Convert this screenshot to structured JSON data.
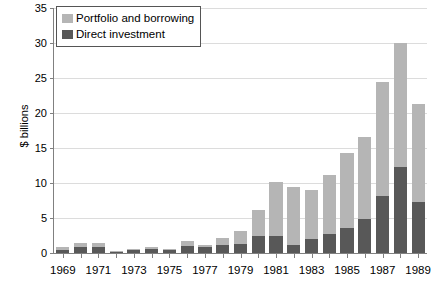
{
  "chart_data": {
    "type": "bar",
    "title": "",
    "subtitle": "",
    "xlabel": "",
    "ylabel": "$ billions",
    "ylim": [
      0,
      35
    ],
    "ytick_step": 5,
    "yticks": [
      "0",
      "5",
      "10",
      "15",
      "20",
      "25",
      "30",
      "35"
    ],
    "grid": true,
    "stacked": true,
    "legend_position": "top-left",
    "categories": [
      "1969",
      "1970",
      "1971",
      "1972",
      "1973",
      "1974",
      "1975",
      "1976",
      "1977",
      "1978",
      "1979",
      "1980",
      "1981",
      "1982",
      "1983",
      "1984",
      "1985",
      "1986",
      "1987",
      "1988",
      "1989"
    ],
    "xtick_labels": [
      "1969",
      "",
      "1971",
      "",
      "1973",
      "",
      "1975",
      "",
      "1977",
      "",
      "1979",
      "",
      "1981",
      "",
      "1983",
      "",
      "1985",
      "",
      "1987",
      "",
      "1989"
    ],
    "series": [
      {
        "name": "Direct investment",
        "color": "#585858",
        "values": [
          0.5,
          0.8,
          0.8,
          0.2,
          0.4,
          0.6,
          0.4,
          1.0,
          0.9,
          1.1,
          1.3,
          2.5,
          2.5,
          1.1,
          2.0,
          2.7,
          3.6,
          4.8,
          8.1,
          12.3,
          7.3
        ]
      },
      {
        "name": "Portfolio and borrowing",
        "color": "#b5b5b5",
        "values": [
          0.4,
          0.7,
          0.7,
          0.1,
          0.2,
          0.3,
          0.2,
          0.7,
          0.3,
          1.1,
          1.9,
          3.7,
          7.6,
          8.4,
          7.0,
          8.4,
          10.7,
          11.8,
          16.3,
          17.7,
          14.0
        ]
      }
    ],
    "totals": [
      0.9,
      1.5,
      1.5,
      0.3,
      0.6,
      0.9,
      0.6,
      1.7,
      1.2,
      2.2,
      3.2,
      6.2,
      10.1,
      9.5,
      9.0,
      11.1,
      14.3,
      16.6,
      24.4,
      30.0,
      21.3
    ]
  },
  "legend": {
    "items": [
      {
        "label": "Portfolio and borrowing",
        "swatch_name": "legend-swatch-portfolio"
      },
      {
        "label": "Direct investment",
        "swatch_name": "legend-swatch-direct"
      }
    ]
  },
  "axes": {
    "y_title": "$ billions"
  },
  "colors": {
    "portfolio": "#b5b5b5",
    "direct": "#585858",
    "grid": "#dcdcdc",
    "axis": "#808080",
    "text": "#000000",
    "background": "#ffffff"
  }
}
